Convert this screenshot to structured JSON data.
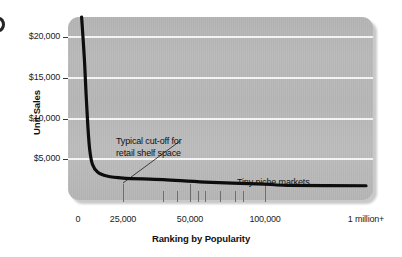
{
  "figure": {
    "edge_mark_name": "page-edge-mark"
  },
  "chart_data": {
    "type": "line",
    "title": "",
    "xlabel": "Ranking by Popularity",
    "ylabel": "Unit Sales",
    "x_tick_labels": [
      "0",
      "25,000",
      "50,000",
      "100,000",
      "1 million+"
    ],
    "y_tick_labels": [
      "$20,000",
      "$15,000",
      "$10,000",
      "$5,000"
    ],
    "y_tick_values": [
      20000,
      15000,
      10000,
      5000
    ],
    "ylim": [
      0,
      22500
    ],
    "xlim": [
      0,
      1000000
    ],
    "grid": "horizontal",
    "legend": "none",
    "series": [
      {
        "name": "Unit sales by popularity rank",
        "points": [
          {
            "x": 2000,
            "y": 22500
          },
          {
            "x": 3500,
            "y": 17500
          },
          {
            "x": 4500,
            "y": 13000
          },
          {
            "x": 5500,
            "y": 9000
          },
          {
            "x": 6500,
            "y": 6200
          },
          {
            "x": 8000,
            "y": 4400
          },
          {
            "x": 11000,
            "y": 3400
          },
          {
            "x": 16000,
            "y": 2950
          },
          {
            "x": 25000,
            "y": 2700
          },
          {
            "x": 40000,
            "y": 2500
          },
          {
            "x": 60000,
            "y": 2200
          },
          {
            "x": 100000,
            "y": 1950
          },
          {
            "x": 300000,
            "y": 1800
          },
          {
            "x": 1000000,
            "y": 1750
          }
        ]
      }
    ],
    "annotations": [
      {
        "id": "cutoff",
        "text": "Typical cut-off for\nretail shelf space",
        "leader": true,
        "points_to_x": 25000
      },
      {
        "id": "niche",
        "text": "Tiny niche markets",
        "leader": false
      }
    ],
    "colors": {
      "curve": "#0d0d0d",
      "panel": "#b7b7b7",
      "gridline": "#f4f4f4",
      "text": "#111111",
      "tick": "#6e6e6e"
    }
  }
}
